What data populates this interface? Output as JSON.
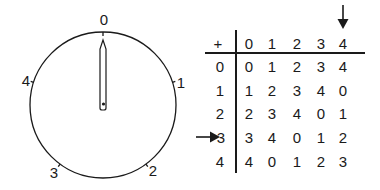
{
  "dial": {
    "labels": [
      "0",
      "1",
      "2",
      "3",
      "4"
    ],
    "pointer_value": "0"
  },
  "table": {
    "operator": "+",
    "column_headers": [
      "0",
      "1",
      "2",
      "3",
      "4"
    ],
    "row_headers": [
      "0",
      "1",
      "2",
      "3",
      "4"
    ],
    "rows": [
      [
        "0",
        "1",
        "2",
        "3",
        "4"
      ],
      [
        "1",
        "2",
        "3",
        "4",
        "0"
      ],
      [
        "2",
        "3",
        "4",
        "0",
        "1"
      ],
      [
        "3",
        "4",
        "0",
        "1",
        "2"
      ],
      [
        "4",
        "0",
        "1",
        "2",
        "3"
      ]
    ],
    "highlighted_column": "4",
    "highlighted_row": "3"
  }
}
